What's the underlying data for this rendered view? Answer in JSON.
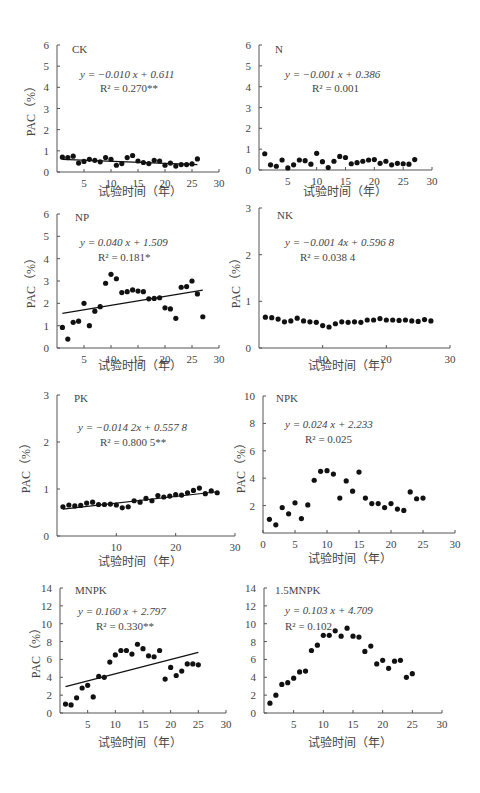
{
  "chart_data": [
    {
      "id": "CK",
      "type": "scatter",
      "label": "CK",
      "equation": "y = −0.010 x + 0.611",
      "r2": "R² = 0.270**",
      "xlabel": "试验时间（年）",
      "ylabel": "PAC（%）",
      "xlim": [
        0,
        30
      ],
      "ylim": [
        0,
        6
      ],
      "xticks": [
        5,
        10,
        15,
        20,
        25,
        30
      ],
      "yticks": [
        0,
        1,
        2,
        3,
        4,
        5,
        6
      ],
      "x": [
        1,
        2,
        3,
        4,
        5,
        6,
        7,
        8,
        9,
        10,
        11,
        12,
        13,
        14,
        15,
        16,
        17,
        18,
        19,
        20,
        21,
        22,
        23,
        24,
        25,
        26
      ],
      "y": [
        0.7,
        0.68,
        0.75,
        0.42,
        0.5,
        0.6,
        0.55,
        0.48,
        0.68,
        0.6,
        0.32,
        0.4,
        0.68,
        0.78,
        0.52,
        0.45,
        0.4,
        0.55,
        0.52,
        0.32,
        0.42,
        0.28,
        0.35,
        0.35,
        0.38,
        0.62
      ],
      "trendline": {
        "slope": -0.01,
        "intercept": 0.611,
        "x_range": [
          1,
          26
        ]
      }
    },
    {
      "id": "N",
      "type": "scatter",
      "label": "N",
      "equation": "y = −0.001 x + 0.386",
      "r2": "R² = 0.001",
      "xlabel": "试验时间（年）",
      "ylabel": "PAC（%）",
      "xlim": [
        0,
        30
      ],
      "ylim": [
        0,
        6
      ],
      "xticks": [
        5,
        10,
        15,
        20,
        25,
        30
      ],
      "yticks": [
        0,
        1,
        2,
        3,
        4,
        5,
        6
      ],
      "x": [
        1,
        2,
        3,
        4,
        5,
        6,
        7,
        8,
        9,
        10,
        11,
        12,
        13,
        14,
        15,
        16,
        17,
        18,
        19,
        20,
        21,
        22,
        23,
        24,
        25,
        26,
        27
      ],
      "y": [
        0.78,
        0.25,
        0.18,
        0.48,
        0.1,
        0.25,
        0.48,
        0.45,
        0.28,
        0.8,
        0.4,
        0.12,
        0.42,
        0.65,
        0.6,
        0.3,
        0.35,
        0.42,
        0.48,
        0.5,
        0.32,
        0.42,
        0.25,
        0.32,
        0.3,
        0.28,
        0.5
      ],
      "trendline": null
    },
    {
      "id": "NP",
      "type": "scatter",
      "label": "NP",
      "equation": "y = 0.040 x + 1.509",
      "r2": "R² = 0.181*",
      "xlabel": "试验时间（年）",
      "ylabel": "PAC（%）",
      "xlim": [
        0,
        30
      ],
      "ylim": [
        0,
        6
      ],
      "xticks": [
        5,
        10,
        15,
        20,
        25,
        30
      ],
      "yticks": [
        0,
        1,
        2,
        3,
        4,
        5,
        6
      ],
      "x": [
        1,
        2,
        3,
        4,
        5,
        6,
        7,
        8,
        9,
        10,
        11,
        12,
        13,
        14,
        15,
        16,
        17,
        18,
        19,
        20,
        21,
        22,
        23,
        24,
        25,
        26,
        27
      ],
      "y": [
        0.92,
        0.4,
        1.15,
        1.2,
        2.0,
        1.0,
        1.65,
        1.85,
        2.9,
        3.3,
        3.1,
        2.48,
        2.52,
        2.6,
        2.55,
        2.52,
        2.2,
        2.22,
        2.25,
        1.8,
        1.75,
        1.33,
        2.72,
        2.75,
        3.0,
        2.42,
        1.4
      ],
      "trendline": {
        "slope": 0.04,
        "intercept": 1.509,
        "x_range": [
          1,
          27
        ]
      }
    },
    {
      "id": "NK",
      "type": "scatter",
      "label": "NK",
      "equation": "y = −0.001 4x + 0.596 8",
      "r2": "R² = 0.038 4",
      "xlabel": "试验时间（年）",
      "ylabel": "PAC（%）",
      "xlim": [
        0,
        30
      ],
      "ylim": [
        0,
        3
      ],
      "xticks": [
        10,
        20,
        30
      ],
      "yticks": [
        0,
        1,
        2,
        3
      ],
      "x": [
        1,
        2,
        3,
        4,
        5,
        6,
        7,
        8,
        9,
        10,
        11,
        12,
        13,
        14,
        15,
        16,
        17,
        18,
        19,
        20,
        21,
        22,
        23,
        24,
        25,
        26,
        27
      ],
      "y": [
        0.66,
        0.65,
        0.62,
        0.56,
        0.58,
        0.64,
        0.58,
        0.56,
        0.55,
        0.48,
        0.45,
        0.52,
        0.56,
        0.55,
        0.56,
        0.55,
        0.6,
        0.6,
        0.63,
        0.6,
        0.6,
        0.59,
        0.6,
        0.58,
        0.57,
        0.61,
        0.58
      ],
      "trendline": null
    },
    {
      "id": "PK",
      "type": "scatter",
      "label": "PK",
      "equation": "y = −0.014 2x + 0.557 8",
      "r2": "R² = 0.800 5**",
      "xlabel": "试验时间（年）",
      "ylabel": "PAC（%）",
      "xlim": [
        0,
        30
      ],
      "ylim": [
        0,
        3
      ],
      "xticks": [
        10,
        20,
        30
      ],
      "yticks": [
        0,
        1,
        2,
        3
      ],
      "x": [
        1,
        2,
        3,
        4,
        5,
        6,
        7,
        8,
        9,
        10,
        11,
        12,
        13,
        14,
        15,
        16,
        17,
        18,
        19,
        20,
        21,
        22,
        23,
        24,
        25,
        26,
        27
      ],
      "y": [
        0.62,
        0.66,
        0.64,
        0.65,
        0.7,
        0.72,
        0.67,
        0.67,
        0.68,
        0.66,
        0.6,
        0.62,
        0.75,
        0.72,
        0.8,
        0.75,
        0.86,
        0.83,
        0.85,
        0.88,
        0.87,
        0.92,
        0.97,
        1.02,
        0.9,
        0.96,
        0.92
      ],
      "trendline": {
        "slope": 0.0142,
        "intercept": 0.5578,
        "x_range": [
          1,
          27
        ]
      }
    },
    {
      "id": "NPK",
      "type": "scatter",
      "label": "NPK",
      "equation": "y = 0.024 x + 2.233",
      "r2": "R² = 0.025",
      "xlabel": "试验时间（年）",
      "ylabel": "PAC（%）",
      "xlim": [
        0,
        30
      ],
      "ylim": [
        0,
        10
      ],
      "xticks": [
        0,
        5,
        10,
        15,
        20,
        25,
        30
      ],
      "yticks": [
        2,
        4,
        6,
        8,
        10
      ],
      "x": [
        1,
        2,
        3,
        4,
        5,
        6,
        7,
        8,
        9,
        10,
        11,
        12,
        13,
        14,
        15,
        16,
        17,
        18,
        19,
        20,
        21,
        22,
        23,
        24,
        25
      ],
      "y": [
        1.0,
        0.6,
        1.85,
        1.4,
        2.2,
        1.05,
        2.05,
        3.85,
        4.5,
        4.55,
        4.3,
        2.55,
        3.8,
        3.05,
        4.45,
        2.55,
        2.15,
        2.15,
        1.85,
        2.15,
        1.75,
        1.65,
        3.0,
        2.5,
        2.55
      ],
      "trendline": null
    },
    {
      "id": "MNPK",
      "type": "scatter",
      "label": "MNPK",
      "equation": "y = 0.160 x + 2.797",
      "r2": "R² = 0.330**",
      "xlabel": "试验时间（年）",
      "ylabel": "PAC（%）",
      "xlim": [
        0,
        30
      ],
      "ylim": [
        0,
        14
      ],
      "xticks": [
        5,
        10,
        15,
        20,
        25,
        30
      ],
      "yticks": [
        0,
        2,
        4,
        6,
        8,
        10,
        12,
        14
      ],
      "x": [
        1,
        2,
        3,
        4,
        5,
        6,
        7,
        8,
        9,
        10,
        11,
        12,
        13,
        14,
        15,
        16,
        17,
        18,
        19,
        20,
        21,
        22,
        23,
        24,
        25
      ],
      "y": [
        1.0,
        0.9,
        1.7,
        2.8,
        3.1,
        1.8,
        4.1,
        4.0,
        5.7,
        6.5,
        7.0,
        7.0,
        6.6,
        7.7,
        7.2,
        6.4,
        6.3,
        7.0,
        3.8,
        5.1,
        4.2,
        4.7,
        5.5,
        5.5,
        5.4
      ],
      "trendline": {
        "slope": 0.16,
        "intercept": 2.797,
        "x_range": [
          1,
          25
        ]
      }
    },
    {
      "id": "1.5MNPK",
      "type": "scatter",
      "label": "1.5MNPK",
      "equation": "y = 0.103 x + 4.709",
      "r2": "R² = 0.102",
      "xlabel": "试验时间（年）",
      "ylabel": "PAC（%）",
      "xlim": [
        0,
        30
      ],
      "ylim": [
        0,
        14
      ],
      "xticks": [
        5,
        10,
        15,
        20,
        25,
        30
      ],
      "yticks": [
        0,
        2,
        4,
        6,
        8,
        10,
        12,
        14
      ],
      "x": [
        1,
        2,
        3,
        4,
        5,
        6,
        7,
        8,
        9,
        10,
        11,
        12,
        13,
        14,
        15,
        16,
        17,
        18,
        19,
        20,
        21,
        22,
        23,
        24,
        25
      ],
      "y": [
        1.1,
        2.0,
        3.2,
        3.4,
        3.9,
        4.6,
        4.7,
        7.0,
        7.6,
        8.7,
        8.7,
        9.2,
        8.6,
        9.5,
        8.6,
        8.5,
        6.9,
        7.5,
        5.5,
        5.9,
        5.0,
        5.8,
        5.9,
        4.0,
        4.4
      ],
      "trendline": null
    }
  ]
}
